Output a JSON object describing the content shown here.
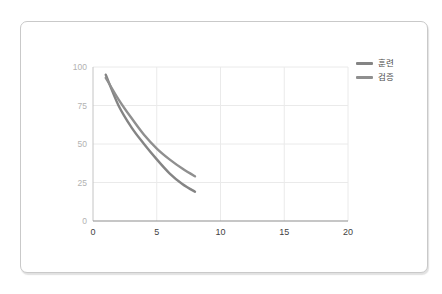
{
  "page": {
    "background": "#ffffff"
  },
  "card": {
    "border_color": "#c9c9c9",
    "background": "#ffffff"
  },
  "chart_data": {
    "type": "line",
    "title": "",
    "xlabel": "",
    "ylabel": "",
    "x": [
      1,
      2,
      3,
      4,
      5,
      6,
      7,
      8
    ],
    "series": [
      {
        "name": "훈련",
        "values": [
          95,
          75,
          61,
          50,
          40,
          31,
          24,
          19
        ],
        "color": "#848484"
      },
      {
        "name": "검증",
        "values": [
          93,
          79,
          67,
          56,
          47,
          40,
          34,
          29
        ],
        "color": "#8f8f8f"
      }
    ],
    "xlim": [
      0,
      20
    ],
    "ylim": [
      0,
      100
    ],
    "xticks": [
      0,
      5,
      10,
      15,
      20
    ],
    "yticks": [
      0,
      25,
      50,
      75,
      100
    ],
    "grid": true,
    "legend_position": "upper-right-outside",
    "legend": [
      "훈련",
      "검증"
    ]
  },
  "colors": {
    "gridline": "#eaeaea",
    "left_spine": "#c4c4c4",
    "bottom_spine": "#8d8d8d",
    "y_tick_label": "#b2b2b2",
    "x_tick_label": "#3f3f3f",
    "legend_text": "#4c4c4c"
  }
}
